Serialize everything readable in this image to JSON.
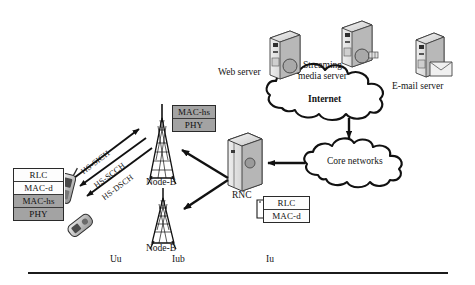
{
  "figure": {
    "type": "network-architecture-diagram"
  },
  "ue": {
    "stack_name": "ue-protocol-stack",
    "layers": [
      {
        "label": "RLC",
        "shade": "white"
      },
      {
        "label": "MAC-d",
        "shade": "white"
      },
      {
        "label": "MAC-hs",
        "shade": "gray"
      },
      {
        "label": "PHY",
        "shade": "gray"
      }
    ],
    "devices": [
      "mobile-handset-1",
      "mobile-handset-2"
    ]
  },
  "nodeb": {
    "stack_name": "nodeb-protocol-stack",
    "layers": [
      {
        "label": "MAC-hs",
        "shade": "gray"
      },
      {
        "label": "PHY",
        "shade": "gray"
      }
    ],
    "upper_label": "Node-B",
    "lower_label": "Node-B"
  },
  "rnc": {
    "label": "RNC",
    "stack_name": "rnc-protocol-stack",
    "layers": [
      {
        "label": "RLC",
        "shade": "white"
      },
      {
        "label": "MAC-d",
        "shade": "white"
      }
    ]
  },
  "channels": [
    {
      "label": "HS-SICH",
      "direction": "uplink",
      "name": "hs-sich-arrow"
    },
    {
      "label": "HS-SCCH",
      "direction": "downlink",
      "name": "hs-scch-arrow"
    },
    {
      "label": "HS-DSCH",
      "direction": "downlink",
      "name": "hs-dsch-arrow"
    }
  ],
  "interfaces": [
    {
      "label": "Uu"
    },
    {
      "label": "Iub"
    },
    {
      "label": "Iu"
    }
  ],
  "clouds": [
    {
      "label": "Internet",
      "name": "internet-cloud",
      "bold": true
    },
    {
      "label": "Core networks",
      "name": "core-networks-cloud",
      "bold": false
    }
  ],
  "servers": [
    {
      "label": "Web server",
      "name": "web-server"
    },
    {
      "label": "Streaming\nmedia server",
      "name": "streaming-media-server",
      "line1": "Streaming",
      "line2": "media server"
    },
    {
      "label": "E-mail server",
      "name": "email-server"
    }
  ],
  "colors": {
    "gray_layer": "#a3a3a3",
    "white_layer": "#fdfdfd",
    "stroke": "#111111",
    "server_body": "#d7d7d7",
    "server_shade": "#9c9c9c"
  }
}
